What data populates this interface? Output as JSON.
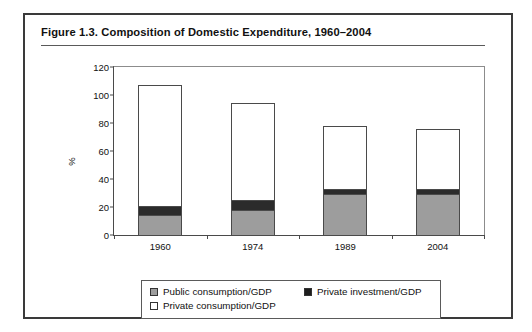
{
  "figure": {
    "title": "Figure 1.3.  Composition of Domestic Expenditure, 1960–2004"
  },
  "legend": {
    "items": [
      {
        "label": "Public consumption/GDP",
        "swatch": "public-consumption-swatch",
        "color": "#9d9d9d"
      },
      {
        "label": "Private investment/GDP",
        "swatch": "private-investment-swatch",
        "color": "#1d1d1d"
      },
      {
        "label": "Private consumption/GDP",
        "swatch": "private-consumption-swatch",
        "color": "#ffffff"
      }
    ]
  },
  "chart_data": {
    "type": "bar",
    "subtype": "stacked-column",
    "title": "Figure 1.3.  Composition of Domestic Expenditure, 1960–2004",
    "xlabel": "",
    "ylabel": "%",
    "categories": [
      "1960",
      "1974",
      "1989",
      "2004"
    ],
    "ylim": [
      0,
      120
    ],
    "yticks": [
      0,
      20,
      40,
      60,
      80,
      100,
      120
    ],
    "ytick_labels": [
      "0",
      "20",
      "40",
      "60",
      "80",
      "100",
      "120"
    ],
    "grid": false,
    "legend_position": "bottom",
    "series": [
      {
        "name": "Public consumption/GDP",
        "color": "#9d9d9d",
        "values": [
          14,
          18,
          29,
          29
        ]
      },
      {
        "name": "Private investment/GDP",
        "color": "#2b2b2b",
        "values": [
          7,
          7,
          4,
          4
        ]
      },
      {
        "name": "Private consumption/GDP",
        "color": "#ffffff",
        "values": [
          86,
          69,
          45,
          43
        ]
      }
    ],
    "totals": [
      107,
      94,
      78,
      76
    ]
  }
}
